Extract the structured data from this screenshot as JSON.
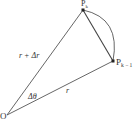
{
  "diagram": {
    "points": {
      "origin": {
        "label": "O",
        "x": 7,
        "y": 115
      },
      "pk": {
        "label": "P",
        "sub": "k",
        "x": 83,
        "y": 10
      },
      "pk1": {
        "label": "P",
        "sub": "k − 1",
        "x": 113,
        "y": 61
      }
    },
    "labels": {
      "long_side": "r + Δr",
      "short_side": "r",
      "angle": "Δθ"
    },
    "colors": {
      "stroke": "#444444",
      "background": "#ffffff"
    }
  }
}
